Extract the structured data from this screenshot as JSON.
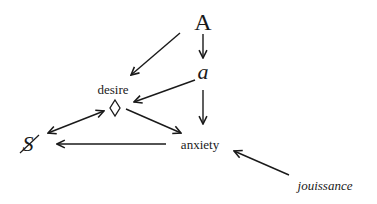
{
  "diagram": {
    "type": "directed-graph",
    "nodes": {
      "A": {
        "label": "A",
        "x": 203,
        "y": 24
      },
      "a": {
        "label": "a",
        "x": 203,
        "y": 74
      },
      "desire": {
        "label": "desire",
        "x": 113,
        "y": 89
      },
      "diamond": {
        "label": "◊",
        "x": 115,
        "y": 108
      },
      "S": {
        "label": "S",
        "x": 27,
        "y": 144
      },
      "anxiety": {
        "label": "anxiety",
        "x": 200,
        "y": 144
      },
      "jouissance": {
        "label": "jouissance",
        "x": 325,
        "y": 185
      }
    },
    "edges": [
      {
        "from": "A",
        "to": "desire",
        "direction": "forward"
      },
      {
        "from": "A",
        "to": "a",
        "direction": "forward"
      },
      {
        "from": "a",
        "to": "diamond",
        "direction": "forward"
      },
      {
        "from": "a",
        "to": "anxiety",
        "direction": "forward"
      },
      {
        "from": "diamond",
        "to": "S",
        "direction": "both"
      },
      {
        "from": "diamond",
        "to": "anxiety",
        "direction": "forward"
      },
      {
        "from": "anxiety",
        "to": "S",
        "direction": "forward"
      },
      {
        "from": "jouissance",
        "to": "anxiety",
        "direction": "forward"
      }
    ]
  }
}
